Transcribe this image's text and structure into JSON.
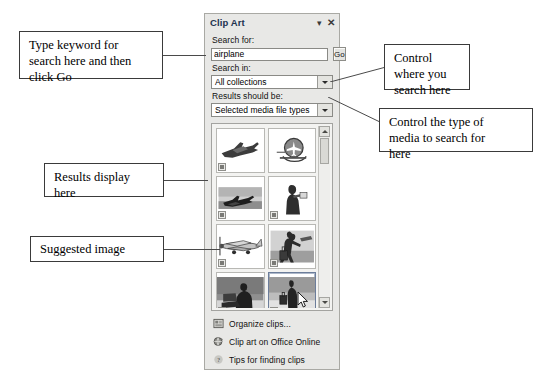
{
  "pane": {
    "title": "Clip Art",
    "menu_icon": "chevron-down-icon",
    "close_icon": "close-icon",
    "search_for_label": "Search for:",
    "search_value": "airplane",
    "search_placeholder": "Search for:",
    "go_label": "Go",
    "search_in_label": "Search in:",
    "search_in_value": "All collections",
    "results_label": "Results should be:",
    "results_value": "Selected media file types"
  },
  "results": {
    "thumbnails": [
      {
        "name": "jet-fighter-silhouette",
        "badge": true,
        "selected": false
      },
      {
        "name": "airplane-globe-logo",
        "badge": false,
        "selected": false
      },
      {
        "name": "airplane-landscape-photo",
        "badge": true,
        "selected": false
      },
      {
        "name": "woman-reading-figure",
        "badge": true,
        "selected": false
      },
      {
        "name": "propeller-plane",
        "badge": true,
        "selected": false
      },
      {
        "name": "traveler-with-luggage",
        "badge": true,
        "selected": false
      },
      {
        "name": "man-at-laptop-photo",
        "badge": true,
        "selected": false
      },
      {
        "name": "businessman-with-briefcase",
        "badge": true,
        "selected": true
      }
    ],
    "scroll_up_icon": "scroll-up-arrow-icon",
    "scroll_down_icon": "scroll-down-arrow-icon"
  },
  "footer": {
    "links": [
      {
        "icon": "organize-clips-icon",
        "label": "Organize clips..."
      },
      {
        "icon": "office-online-icon",
        "label": "Clip art on Office Online"
      },
      {
        "icon": "tips-help-icon",
        "label": "Tips for finding clips"
      }
    ]
  },
  "annotations": {
    "search": [
      "Type keyword for",
      "search here and then",
      "click Go"
    ],
    "results": [
      "Results display",
      "here"
    ],
    "suggested": [
      "Suggested image"
    ],
    "where": [
      "Control",
      "where you",
      "search here"
    ],
    "type": [
      "Control the type of",
      "media to search for",
      "here"
    ]
  },
  "colors": {
    "pane_background": "#e8e8e6",
    "pane_border": "#a9a9a4",
    "title_text": "#22324f",
    "callout_border": "#3a3a3a",
    "leader_line": "#4a4a4a"
  }
}
